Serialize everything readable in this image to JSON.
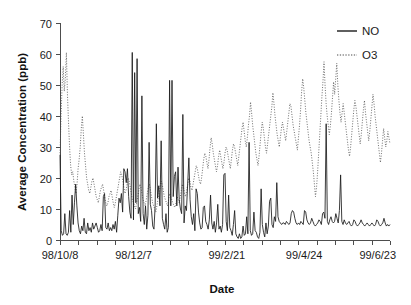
{
  "chart_data": {
    "type": "line",
    "title": "",
    "xlabel": "Date",
    "ylabel": "Average Concentration (ppb)",
    "ylim": [
      0,
      70
    ],
    "ytick_step": 10,
    "yticks": [
      0,
      10,
      20,
      30,
      40,
      50,
      60,
      70
    ],
    "grid": false,
    "legend_position": "top-right",
    "xtick_labels": [
      "98/10/8",
      "98/12/7",
      "99/2/21",
      "99/4/24",
      "99/6/23"
    ],
    "xtick_label_indices": [
      0,
      60,
      136,
      199,
      259
    ],
    "n_points": 270,
    "series": [
      {
        "name": "NO",
        "style": "solid",
        "color": "#1a1a1a",
        "values": [
          27.5,
          3.0,
          1.5,
          2.0,
          8.5,
          2.0,
          1.5,
          2.5,
          9.5,
          2.5,
          14.5,
          5.0,
          12.0,
          18.0,
          11.0,
          5.5,
          3.0,
          2.0,
          4.5,
          3.0,
          7.0,
          2.5,
          2.0,
          5.5,
          3.0,
          4.0,
          2.5,
          5.5,
          3.5,
          4.5,
          5.5,
          4.0,
          2.5,
          3.0,
          5.0,
          3.0,
          14.0,
          15.0,
          4.0,
          3.5,
          5.5,
          3.0,
          4.0,
          3.0,
          5.0,
          3.5,
          6.0,
          2.5,
          8.0,
          13.5,
          12.0,
          15.0,
          9.0,
          23.0,
          22.0,
          18.5,
          23.0,
          14.0,
          9.0,
          7.0,
          60.5,
          6.5,
          54.0,
          12.0,
          58.5,
          8.5,
          10.5,
          6.0,
          46.5,
          8.5,
          5.0,
          11.0,
          3.5,
          8.0,
          31.5,
          11.5,
          9.5,
          4.5,
          3.5,
          11.0,
          37.5,
          13.5,
          17.5,
          11.0,
          32.0,
          7.0,
          5.0,
          3.5,
          8.5,
          2.5,
          4.0,
          51.5,
          11.0,
          51.5,
          14.0,
          20.5,
          22.0,
          11.0,
          23.5,
          13.0,
          10.0,
          8.5,
          40.5,
          5.5,
          11.0,
          9.5,
          18.0,
          26.5,
          13.0,
          7.5,
          5.0,
          8.5,
          3.0,
          16.5,
          15.0,
          9.0,
          5.5,
          3.5,
          4.0,
          10.5,
          11.0,
          6.0,
          5.0,
          3.5,
          6.5,
          14.5,
          5.5,
          3.5,
          6.0,
          2.5,
          5.5,
          11.5,
          3.5,
          4.5,
          2.5,
          5.0,
          21.0,
          21.5,
          6.0,
          3.0,
          14.5,
          4.0,
          3.0,
          1.5,
          5.0,
          9.5,
          2.0,
          1.0,
          0.5,
          2.0,
          0.5,
          1.0,
          4.5,
          1.5,
          2.0,
          7.5,
          2.0,
          31.5,
          3.0,
          1.5,
          2.0,
          9.0,
          3.0,
          2.5,
          1.0,
          0.5,
          2.5,
          16.5,
          5.0,
          2.5,
          1.0,
          5.5,
          2.0,
          4.5,
          12.5,
          13.5,
          5.0,
          4.0,
          7.5,
          6.0,
          18.5,
          7.5,
          6.0,
          5.5,
          5.0,
          5.5,
          5.5,
          5.0,
          6.0,
          5.5,
          5.0,
          5.5,
          8.5,
          9.5,
          9.0,
          7.0,
          5.5,
          5.0,
          5.5,
          5.0,
          6.0,
          5.5,
          5.0,
          9.5,
          9.0,
          6.5,
          5.5,
          5.0,
          5.5,
          7.0,
          6.0,
          5.0,
          4.5,
          5.0,
          5.5,
          6.5,
          6.0,
          5.0,
          8.5,
          9.0,
          7.0,
          37.5,
          6.0,
          5.0,
          6.5,
          7.5,
          6.0,
          5.5,
          6.0,
          8.5,
          7.0,
          5.5,
          9.5,
          21.0,
          6.0,
          5.0,
          6.5,
          5.5,
          5.0,
          5.5,
          6.0,
          5.0,
          4.5,
          5.0,
          6.5,
          6.0,
          5.0,
          4.5,
          5.0,
          5.5,
          6.5,
          5.5,
          5.0,
          4.5,
          5.0,
          5.5,
          5.0,
          4.5,
          5.0,
          5.5,
          5.0,
          4.5,
          5.0,
          6.5,
          6.0,
          5.0,
          4.5,
          5.0,
          5.5,
          7.0,
          5.5,
          4.5,
          5.0,
          4.5,
          5.0
        ]
      },
      {
        "name": "O3",
        "style": "dotted",
        "color": "#4a4a4a",
        "values": [
          28.0,
          40.0,
          50.0,
          56.0,
          48.0,
          52.0,
          60.5,
          47.0,
          38.0,
          30.0,
          24.0,
          21.0,
          22.0,
          19.0,
          17.0,
          15.0,
          18.0,
          23.0,
          26.0,
          30.0,
          36.0,
          40.0,
          34.0,
          28.0,
          24.0,
          20.0,
          18.0,
          16.0,
          15.0,
          17.0,
          19.0,
          20.0,
          18.0,
          16.0,
          14.0,
          13.0,
          12.0,
          14.0,
          16.0,
          17.0,
          18.0,
          16.0,
          14.0,
          12.0,
          11.0,
          12.0,
          14.0,
          15.0,
          16.0,
          14.0,
          12.0,
          10.5,
          12.0,
          14.0,
          16.0,
          18.0,
          20.0,
          22.0,
          21.0,
          19.0,
          17.0,
          15.0,
          16.0,
          18.0,
          20.0,
          19.0,
          17.0,
          15.0,
          13.0,
          12.0,
          11.0,
          10.0,
          12.0,
          14.0,
          16.0,
          18.0,
          17.0,
          15.0,
          13.0,
          12.0,
          11.0,
          13.0,
          15.0,
          17.0,
          18.0,
          16.0,
          14.0,
          12.0,
          11.0,
          10.0,
          9.0,
          11.0,
          13.0,
          15.0,
          17.0,
          19.0,
          18.0,
          16.0,
          14.0,
          13.0,
          12.0,
          11.0,
          13.0,
          15.0,
          14.0,
          13.0,
          12.0,
          11.0,
          10.5,
          12.0,
          14.0,
          13.0,
          12.0,
          14.0,
          16.0,
          18.0,
          17.0,
          15.0,
          14.0,
          16.0,
          18.0,
          20.0,
          19.0,
          17.0,
          16.0,
          18.0,
          20.0,
          22.0,
          24.0,
          23.0,
          21.0,
          19.0,
          18.0,
          20.0,
          23.0,
          26.0,
          28.0,
          27.0,
          25.0,
          23.0,
          26.0,
          30.0,
          33.0,
          31.0,
          28.0,
          26.0,
          24.0,
          22.0,
          24.0,
          27.0,
          29.0,
          27.0,
          25.0,
          23.0,
          25.0,
          28.0,
          30.0,
          29.0,
          27.0,
          25.0,
          23.0,
          26.0,
          29.0,
          31.0,
          30.0,
          28.0,
          26.0,
          24.0,
          27.0,
          30.0,
          33.0,
          36.0,
          38.0,
          35.0,
          32.0,
          30.0,
          33.0,
          37.0,
          40.0,
          44.5,
          41.0,
          37.0,
          34.0,
          31.0,
          28.0,
          26.0,
          24.0,
          27.0,
          31.0,
          35.0,
          38.0,
          36.0,
          33.0,
          30.0,
          28.0,
          31.0,
          34.0,
          37.0,
          40.0,
          43.0,
          47.5,
          44.0,
          40.0,
          37.0,
          34.0,
          32.0,
          30.0,
          33.0,
          36.0,
          38.0,
          36.0,
          34.0,
          32.0,
          35.0,
          38.0,
          41.0,
          44.0,
          43.0,
          40.0,
          37.0,
          35.0,
          33.0,
          31.0,
          29.0,
          33.0,
          37.0,
          42.0,
          48.0,
          52.0,
          49.0,
          45.0,
          41.0,
          38.0,
          35.0,
          32.0,
          30.0,
          28.0,
          25.0,
          22.0,
          18.0,
          14.0,
          17.0,
          22.0,
          28.0,
          34.0,
          40.0,
          46.0,
          51.0,
          57.5,
          50.0,
          44.0,
          40.0,
          37.0,
          34.0,
          37.0,
          41.0,
          46.0,
          51.0,
          47.0,
          52.0,
          57.0,
          50.0,
          45.0,
          41.0,
          38.0,
          41.0,
          44.0,
          41.0,
          38.0,
          35.0,
          32.0,
          29.0,
          27.0,
          30.0,
          34.0,
          38.0,
          42.0,
          45.0,
          43.0,
          40.0,
          37.0,
          34.0,
          31.0,
          34.0,
          38.0,
          42.0,
          45.0,
          41.0,
          38.0,
          35.0,
          32.0,
          35.0,
          39.0,
          43.0,
          47.0,
          44.0,
          40.0,
          37.0,
          34.0,
          31.0,
          28.0,
          25.0,
          28.0,
          32.0,
          36.0,
          33.0,
          30.0,
          32.0,
          35.0,
          33.0,
          31.0
        ]
      }
    ]
  },
  "legend": {
    "items": [
      {
        "label": "NO",
        "style": "solid"
      },
      {
        "label": "O3",
        "style": "dotted"
      }
    ]
  },
  "axes": {
    "y_title": "Average Concentration (ppb)",
    "x_title": "Date"
  }
}
